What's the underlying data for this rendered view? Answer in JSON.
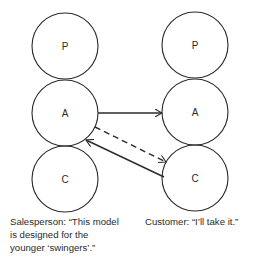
{
  "diagram": {
    "type": "transactional-analysis",
    "left_person": {
      "states": [
        {
          "id": "P",
          "label": "P",
          "cx": 65,
          "cy": 46
        },
        {
          "id": "A",
          "label": "A",
          "cx": 65,
          "cy": 113
        },
        {
          "id": "C",
          "label": "C",
          "cx": 65,
          "cy": 179
        }
      ],
      "caption_lines": [
        "Salesperson: “This model",
        "is designed for the",
        "younger ‘swingers’.”"
      ]
    },
    "right_person": {
      "states": [
        {
          "id": "P",
          "label": "P",
          "cx": 195,
          "cy": 45
        },
        {
          "id": "A",
          "label": "A",
          "cx": 195,
          "cy": 112
        },
        {
          "id": "C",
          "label": "C",
          "cx": 195,
          "cy": 178
        }
      ],
      "caption_lines": [
        "Customer:  “I’ll take it.”"
      ]
    },
    "radius": 33,
    "transactions": [
      {
        "from": "left.A",
        "to": "right.A",
        "style": "solid"
      },
      {
        "from": "left.A",
        "to": "right.C",
        "style": "dashed"
      },
      {
        "from": "right.C",
        "to": "left.A",
        "style": "solid"
      }
    ],
    "colors": {
      "stroke": "#2b2b2b",
      "background": "#ffffff"
    }
  }
}
